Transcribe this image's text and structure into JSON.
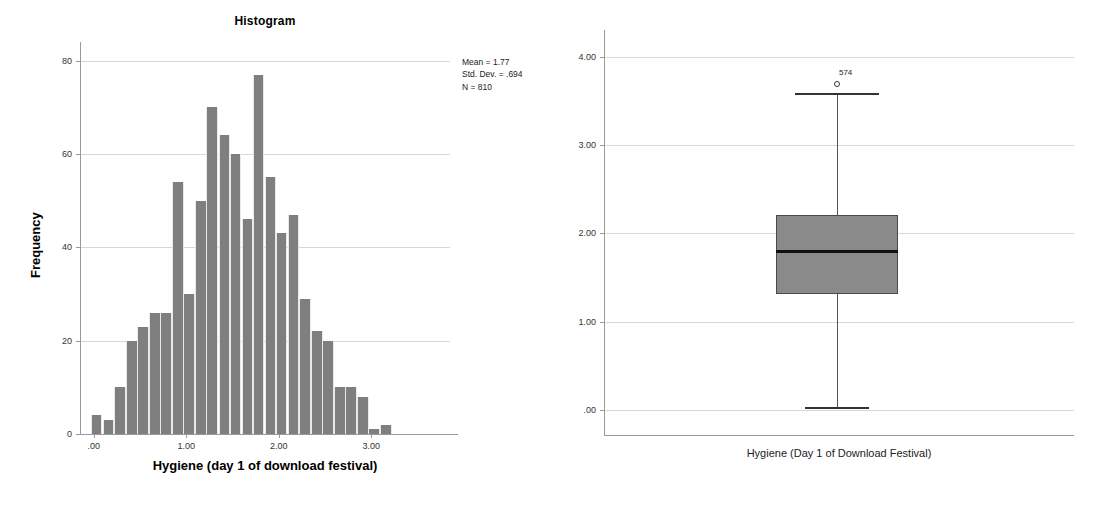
{
  "histogram": {
    "title": "Histogram",
    "xlabel": "Hygiene (day 1 of download festival)",
    "ylabel": "Frequency",
    "stats": {
      "mean_line": "Mean = 1.77",
      "sd_line": "Std. Dev. = .694",
      "n_line": "N = 810"
    },
    "bar_color": "#7f7f7f"
  },
  "boxplot": {
    "xlabel": "Hygiene (Day 1 of Download Festival)",
    "outlier_label": "574",
    "box_color": "#8a8a8a"
  },
  "chart_data": [
    {
      "type": "bar",
      "title": "Histogram",
      "xlabel": "Hygiene (day 1 of download festival)",
      "ylabel": "Frequency",
      "xlim": [
        -0.15,
        3.85
      ],
      "ylim": [
        0,
        84
      ],
      "xticks": [
        ".00",
        "1.00",
        "2.00",
        "3.00"
      ],
      "xtick_values": [
        0,
        1,
        2,
        3
      ],
      "yticks": [
        "0",
        "20",
        "40",
        "60",
        "80"
      ],
      "ytick_values": [
        0,
        20,
        40,
        60,
        80
      ],
      "grid": true,
      "bin_width": 0.125,
      "bin_centers": [
        0.03,
        0.16,
        0.28,
        0.41,
        0.53,
        0.66,
        0.78,
        0.91,
        1.03,
        1.16,
        1.28,
        1.41,
        1.53,
        1.66,
        1.78,
        1.91,
        2.03,
        2.16,
        2.28,
        2.41,
        2.53,
        2.66,
        2.78,
        2.91,
        3.03,
        3.16,
        3.28,
        3.41,
        3.53,
        3.66
      ],
      "values": [
        4,
        3,
        10,
        20,
        23,
        26,
        26,
        54,
        30,
        50,
        70,
        64,
        60,
        46,
        77,
        55,
        43,
        47,
        29,
        22,
        20,
        10,
        10,
        8,
        1,
        2
      ],
      "annotations": [
        "Mean = 1.77",
        "Std. Dev. = .694",
        "N = 810"
      ],
      "statistics": {
        "mean": 1.77,
        "std_dev": 0.694,
        "n": 810
      }
    },
    {
      "type": "boxplot",
      "xlabel": "Hygiene (Day 1 of Download Festival)",
      "ylabel": "",
      "ylim": [
        -0.28,
        4.3
      ],
      "yticks": [
        ".00",
        "1.00",
        "2.00",
        "3.00",
        "4.00"
      ],
      "ytick_values": [
        0,
        1,
        2,
        3,
        4
      ],
      "grid": true,
      "categories": [
        "Hygiene (Day 1 of Download Festival)"
      ],
      "boxes": [
        {
          "q1": 1.31,
          "median": 1.79,
          "q3": 2.21,
          "whisker_low": 0.02,
          "whisker_high": 3.58,
          "outliers": [
            {
              "label": "574",
              "value": 3.69
            }
          ]
        }
      ]
    }
  ]
}
